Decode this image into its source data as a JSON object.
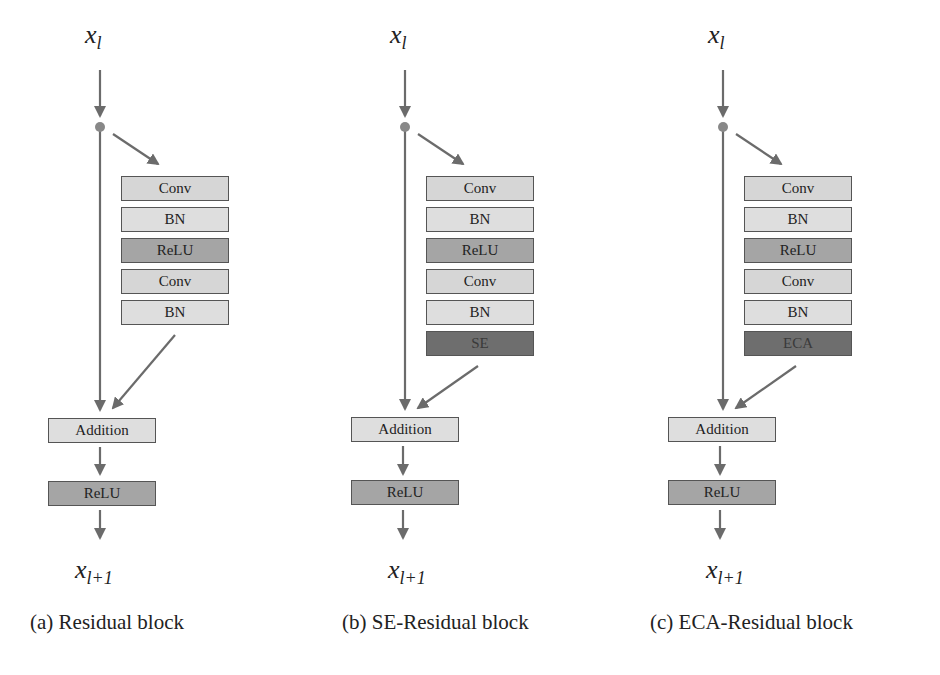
{
  "colors": {
    "wire": "#6b6b6b",
    "box_border": "#555555",
    "conv": "#d6d6d6",
    "bn": "#dedede",
    "relu": "#a5a5a5",
    "attention": "#6e6e6e"
  },
  "blocks": [
    {
      "id": "a",
      "input": {
        "base": "x",
        "sub": "l"
      },
      "output": {
        "base": "x",
        "sub": "l+1"
      },
      "stack": [
        "Conv",
        "BN",
        "ReLU",
        "Conv",
        "BN"
      ],
      "addition": "Addition",
      "relu": "ReLU",
      "caption": "(a) Residual block"
    },
    {
      "id": "b",
      "input": {
        "base": "x",
        "sub": "l"
      },
      "output": {
        "base": "x",
        "sub": "l+1"
      },
      "stack": [
        "Conv",
        "BN",
        "ReLU",
        "Conv",
        "BN",
        "SE"
      ],
      "addition": "Addition",
      "relu": "ReLU",
      "caption": "(b) SE-Residual block"
    },
    {
      "id": "c",
      "input": {
        "base": "x",
        "sub": "l"
      },
      "output": {
        "base": "x",
        "sub": "l+1"
      },
      "stack": [
        "Conv",
        "BN",
        "ReLU",
        "Conv",
        "BN",
        "ECA"
      ],
      "addition": "Addition",
      "relu": "ReLU",
      "caption": "(c) ECA-Residual block"
    }
  ]
}
